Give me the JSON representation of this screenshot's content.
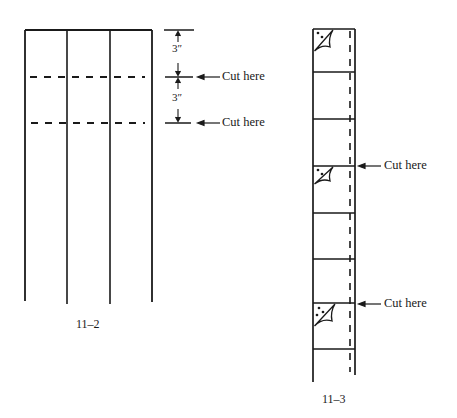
{
  "figures": [
    {
      "id": "fig-11-2",
      "caption": "11–2",
      "dimensions": [
        "3″",
        "3″"
      ],
      "cut_labels": [
        "Cut here",
        "Cut here"
      ]
    },
    {
      "id": "fig-11-3",
      "caption": "11–3",
      "cut_labels": [
        "Cut here",
        "Cut here"
      ]
    }
  ],
  "colors": {
    "ink": "#1a1a1a",
    "background": "#ffffff"
  }
}
